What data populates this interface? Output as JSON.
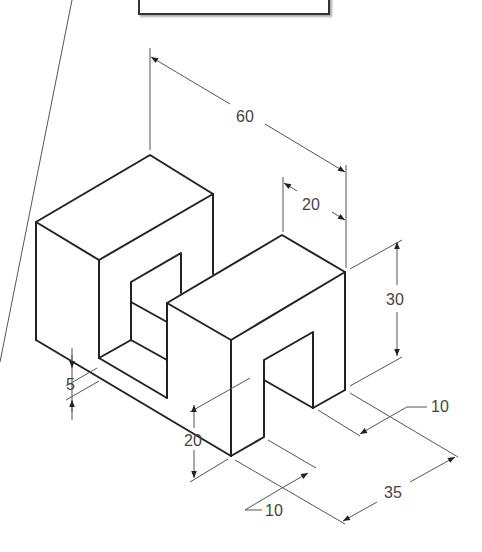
{
  "figure": {
    "type": "isometric technical drawing",
    "title_box_text": ""
  },
  "dimensions": [
    {
      "id": "overall-length",
      "label": "60"
    },
    {
      "id": "block-width",
      "label": "20"
    },
    {
      "id": "height",
      "label": "30"
    },
    {
      "id": "slot-width-right",
      "label": "10"
    },
    {
      "id": "depth",
      "label": "35"
    },
    {
      "id": "slot-width-front",
      "label": "10"
    },
    {
      "id": "slot-height",
      "label": "20"
    },
    {
      "id": "base-thickness",
      "label": "5"
    }
  ]
}
